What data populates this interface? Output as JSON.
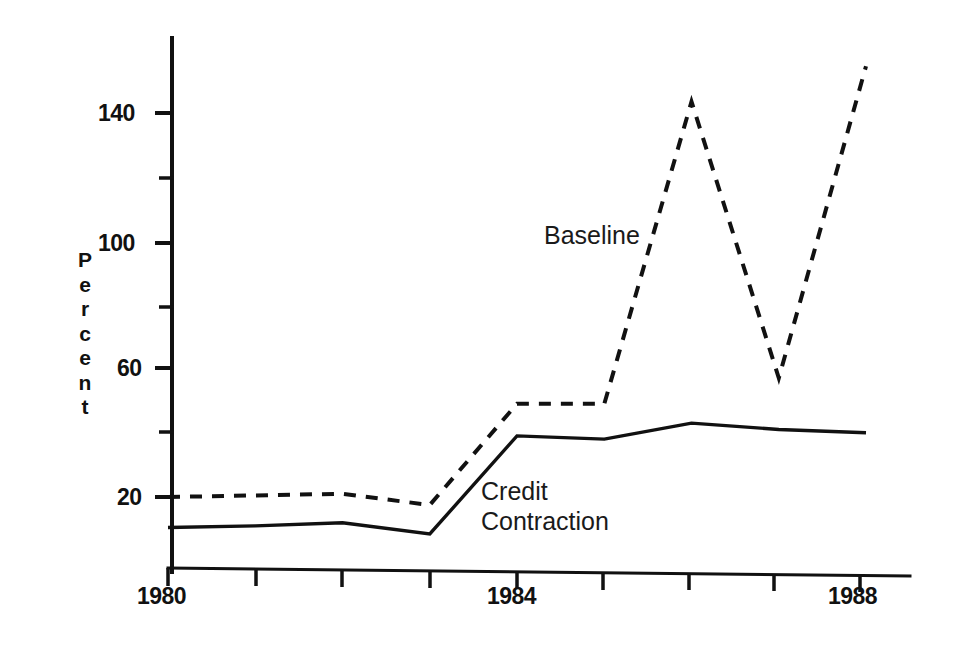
{
  "chart_data": {
    "type": "line",
    "title": "",
    "xlabel": "",
    "ylabel": "Percent",
    "xlim": [
      1980,
      1988
    ],
    "ylim": [
      0,
      160
    ],
    "grid": false,
    "legend_position": "inline-annotation",
    "x": [
      1980,
      1981,
      1982,
      1983,
      1984,
      1985,
      1986,
      1987,
      1988
    ],
    "x_tick_labels": [
      "1980",
      "1984",
      "1988"
    ],
    "x_tick_values": [
      1980,
      1984,
      1988
    ],
    "x_minor_tick_values": [
      1981,
      1982,
      1983,
      1985,
      1986,
      1987
    ],
    "y_tick_labels": [
      "140",
      "100",
      "60",
      "20"
    ],
    "y_tick_values": [
      140,
      100,
      60,
      20
    ],
    "y_minor_tick_values": [
      120,
      80,
      40
    ],
    "series": [
      {
        "name": "Baseline",
        "style": "dashed",
        "color": "#111111",
        "values": [
          20,
          20.5,
          21,
          17.5,
          49,
          49,
          143,
          57,
          154
        ]
      },
      {
        "name": "Credit Contraction",
        "style": "solid",
        "color": "#111111",
        "values": [
          10.5,
          11,
          12,
          8.5,
          39,
          38,
          43,
          41,
          40
        ]
      }
    ],
    "annotations": [
      {
        "text": "Baseline",
        "series": "Baseline"
      },
      {
        "text": "Credit\nContraction",
        "series": "Credit Contraction"
      }
    ]
  },
  "axis": {
    "y_title_letters": [
      "P",
      "e",
      "r",
      "c",
      "e",
      "n",
      "t"
    ],
    "y_labels": {
      "t140": "140",
      "t100": "100",
      "t60": "60",
      "t20": "20"
    },
    "x_labels": {
      "t1980": "1980",
      "t1984": "1984",
      "t1988": "1988"
    }
  },
  "labels": {
    "baseline": "Baseline",
    "credit_line1": "Credit",
    "credit_line2": "Contraction"
  },
  "colors": {
    "ink": "#111111",
    "background": "#ffffff"
  }
}
